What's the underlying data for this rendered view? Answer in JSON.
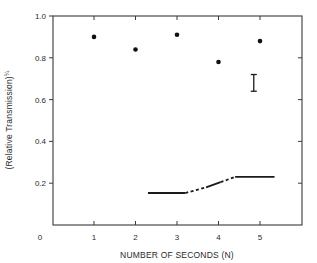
{
  "chart_data": {
    "type": "scatter",
    "title": "",
    "xlabel": "NUMBER OF SECONDS (N)",
    "ylabel": "(Relative Transmission)",
    "ylabel_superscript": "¼",
    "xlim": [
      0,
      6
    ],
    "ylim": [
      0,
      1.0
    ],
    "x_origin_label": "0",
    "x_ticks": [
      1,
      2,
      3,
      4,
      5
    ],
    "x_tick_labels": [
      "1",
      "2",
      "3",
      "4",
      "5"
    ],
    "y_ticks": [
      0.2,
      0.4,
      0.6,
      0.8,
      1.0
    ],
    "y_tick_labels": [
      "0.2",
      "0.4",
      "0.6",
      "0.8",
      "1.0"
    ],
    "grid": false,
    "legend": null,
    "series": [
      {
        "name": "measured points",
        "marker": "filled-circle",
        "x": [
          1,
          2,
          3,
          4,
          5
        ],
        "y": [
          0.9,
          0.84,
          0.91,
          0.78,
          0.88
        ]
      },
      {
        "name": "baseline curve",
        "style": "solid-and-dashed line",
        "segments": [
          {
            "style": "solid",
            "x": [
              2.3,
              3.2
            ],
            "y": [
              0.153,
              0.153
            ]
          },
          {
            "style": "dashed",
            "x": [
              3.2,
              3.7
            ],
            "y": [
              0.153,
              0.18
            ]
          },
          {
            "style": "solid",
            "x": [
              3.7,
              4.05
            ],
            "y": [
              0.18,
              0.205
            ]
          },
          {
            "style": "dashed",
            "x": [
              4.05,
              4.4
            ],
            "y": [
              0.205,
              0.23
            ]
          },
          {
            "style": "solid",
            "x": [
              4.4,
              5.35
            ],
            "y": [
              0.23,
              0.23
            ]
          }
        ]
      }
    ],
    "annotations": [
      {
        "type": "error-bar-scale",
        "x": 4.85,
        "y_range": [
          0.64,
          0.72
        ],
        "description": "representative error bar"
      }
    ]
  }
}
